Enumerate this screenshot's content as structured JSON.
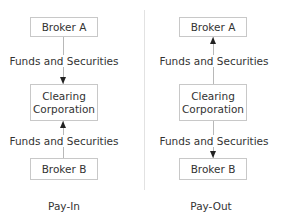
{
  "payin": {
    "top_box": "Broker A",
    "middle_box": "Clearing Corporation",
    "bottom_box": "Broker B",
    "upper_flow_label": "Funds and Securities",
    "lower_flow_label": "Funds and Securities",
    "caption": "Pay-In"
  },
  "payout": {
    "top_box": "Broker A",
    "middle_box": "Clearing Corporation",
    "bottom_box": "Broker B",
    "upper_flow_label": "Funds and Securities",
    "lower_flow_label": "Funds and Securities",
    "caption": "Pay-Out"
  }
}
